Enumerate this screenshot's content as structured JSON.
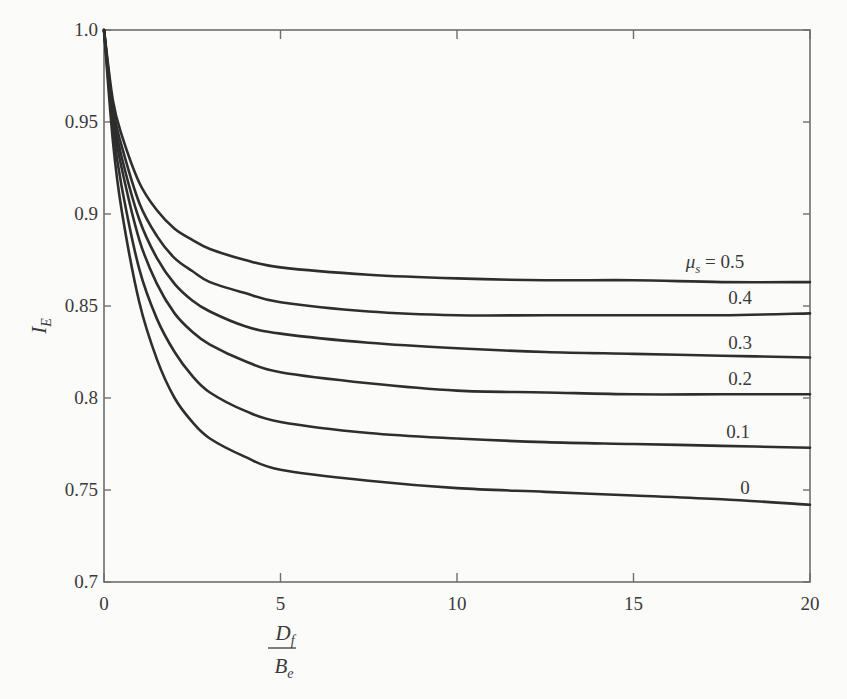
{
  "chart_data": {
    "type": "line",
    "title": "",
    "xlabel": "D_f / B_e",
    "xlabel_parts": {
      "numerator": "D",
      "numerator_sub": "f",
      "denominator": "B",
      "denominator_sub": "e"
    },
    "ylabel": "I_E",
    "ylabel_parts": {
      "main": "I",
      "sub": "E"
    },
    "xlim": [
      0,
      20
    ],
    "ylim": [
      0.7,
      1.0
    ],
    "xticks": [
      0,
      5,
      10,
      15,
      20
    ],
    "xtick_labels": [
      "0",
      "5",
      "10",
      "15",
      "20"
    ],
    "yticks": [
      0.7,
      0.75,
      0.8,
      0.85,
      0.9,
      0.95,
      1.0
    ],
    "ytick_labels": [
      "0.7",
      "0.75",
      "0.8",
      "0.85",
      "0.9",
      "0.95",
      "1.0"
    ],
    "grid": false,
    "legend": "inline labels at right end of curves",
    "x": [
      0,
      0.25,
      0.5,
      1,
      1.5,
      2,
      2.5,
      3,
      4,
      5,
      7.5,
      10,
      12.5,
      15,
      17.5,
      20
    ],
    "series": [
      {
        "name": "μs = 0.5",
        "label": "μs = 0.5",
        "values": [
          1.0,
          0.962,
          0.943,
          0.917,
          0.902,
          0.892,
          0.886,
          0.881,
          0.875,
          0.871,
          0.867,
          0.865,
          0.864,
          0.864,
          0.863,
          0.863
        ]
      },
      {
        "name": "0.4",
        "label": "0.4",
        "values": [
          1.0,
          0.958,
          0.937,
          0.906,
          0.888,
          0.876,
          0.869,
          0.863,
          0.857,
          0.852,
          0.847,
          0.845,
          0.845,
          0.845,
          0.845,
          0.846
        ]
      },
      {
        "name": "0.3",
        "label": "0.3",
        "values": [
          1.0,
          0.955,
          0.931,
          0.897,
          0.876,
          0.862,
          0.853,
          0.847,
          0.839,
          0.835,
          0.83,
          0.827,
          0.825,
          0.824,
          0.823,
          0.822
        ]
      },
      {
        "name": "0.2",
        "label": "0.2",
        "values": [
          1.0,
          0.952,
          0.925,
          0.886,
          0.862,
          0.846,
          0.836,
          0.829,
          0.82,
          0.814,
          0.808,
          0.804,
          0.803,
          0.802,
          0.802,
          0.802
        ]
      },
      {
        "name": "0.1",
        "label": "0.1",
        "values": [
          1.0,
          0.947,
          0.915,
          0.87,
          0.843,
          0.825,
          0.812,
          0.803,
          0.793,
          0.787,
          0.781,
          0.778,
          0.776,
          0.775,
          0.774,
          0.773
        ]
      },
      {
        "name": "0",
        "label": "0",
        "values": [
          1.0,
          0.94,
          0.902,
          0.852,
          0.821,
          0.8,
          0.787,
          0.778,
          0.768,
          0.761,
          0.755,
          0.751,
          0.749,
          0.747,
          0.745,
          0.742
        ]
      }
    ]
  },
  "colors": {
    "background": "#fbfbfa",
    "axis": "#6e6e6e",
    "curve": "#2e2e2e",
    "text": "#3a3a3a"
  }
}
